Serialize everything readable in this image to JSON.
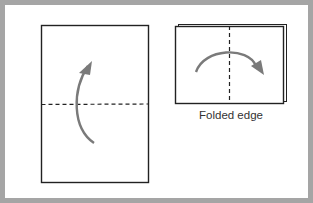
{
  "diagram": {
    "steps": [
      {
        "name": "step-1",
        "description": "Fold bottom half up along horizontal dashed line"
      },
      {
        "name": "step-2",
        "description": "Fold along vertical dashed line, arrow to the right"
      }
    ],
    "caption": "Folded edge",
    "colors": {
      "frame": "#a5a5a5",
      "paper_stroke": "#222222",
      "arrow": "#7a7a7a",
      "background": "#ffffff"
    }
  }
}
